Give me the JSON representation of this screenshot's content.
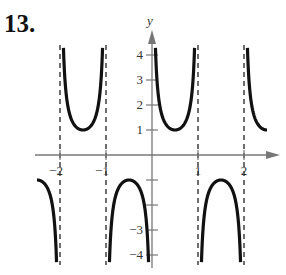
{
  "problem_number": "13.",
  "chart_data": {
    "type": "line",
    "title": "",
    "function": "y = csc(πx)",
    "xlabel": "x",
    "ylabel": "y",
    "xlim": [
      -2.5,
      2.5
    ],
    "ylim": [
      -4.3,
      4.3
    ],
    "x_ticks": [
      -2,
      -1,
      1,
      2
    ],
    "x_tick_labels": [
      "−2",
      "−1",
      "1",
      "2"
    ],
    "y_ticks": [
      -4,
      -3,
      -2,
      -1,
      1,
      2,
      3,
      4
    ],
    "y_tick_labels": [
      "−4",
      "−3",
      "",
      "",
      "1",
      "2",
      "3",
      "4"
    ],
    "vertical_asymptotes": [
      -2,
      -1,
      0,
      1,
      2
    ],
    "asymptote_style": "dashed",
    "grid": false,
    "legend": null,
    "branches": [
      {
        "interval": [
          -2.5,
          -2
        ],
        "direction": "down",
        "vertex": {
          "x": -2.5,
          "y": -1
        }
      },
      {
        "interval": [
          -2,
          -1
        ],
        "direction": "up",
        "vertex": {
          "x": -1.5,
          "y": 1
        }
      },
      {
        "interval": [
          -1,
          0
        ],
        "direction": "down",
        "vertex": {
          "x": -0.5,
          "y": -1
        }
      },
      {
        "interval": [
          0,
          1
        ],
        "direction": "up",
        "vertex": {
          "x": 0.5,
          "y": 1
        }
      },
      {
        "interval": [
          1,
          2
        ],
        "direction": "down",
        "vertex": {
          "x": 1.5,
          "y": -1
        }
      },
      {
        "interval": [
          2,
          2.5
        ],
        "direction": "up",
        "vertex": {
          "x": 2.5,
          "y": 1
        }
      }
    ],
    "colors": {
      "curve": "#111111",
      "axis": "#777777",
      "asymptote": "#333333"
    }
  }
}
